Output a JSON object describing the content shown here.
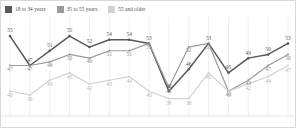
{
  "legend": {
    "position": "top-left",
    "items": [
      {
        "label": "18 to 34 years",
        "color": "#595959",
        "icon": "square-swatch"
      },
      {
        "label": "35 to 55 years",
        "color": "#9a9a9a",
        "icon": "square-swatch"
      },
      {
        "label": "55 and older",
        "color": "#d2d2d2",
        "icon": "square-swatch"
      }
    ]
  },
  "chart_data": {
    "type": "line",
    "title": "",
    "subtitle": "",
    "xlabel": "",
    "ylabel": "",
    "ylim": [
      36,
      58
    ],
    "grid": "vertical-only",
    "legend_position": "top-left",
    "x": [
      1,
      2,
      3,
      4,
      5,
      6,
      7,
      8,
      9,
      10,
      11,
      12,
      13,
      14,
      15
    ],
    "categories": [
      "",
      "",
      "",
      "",
      "",
      "",
      "",
      "",
      "",
      "",
      "",
      "",
      "",
      "",
      ""
    ],
    "series": [
      {
        "name": "18 to 34 years",
        "color": "#595959",
        "values": [
          55,
          47,
          51,
          55,
          52,
          54,
          54,
          53,
          40,
          46,
          53,
          45,
          49,
          50,
          53
        ]
      },
      {
        "name": "35 to 55 years",
        "color": "#9a9a9a",
        "values": [
          47,
          47,
          48,
          50,
          49,
          51,
          51,
          53,
          41,
          52,
          53,
          40,
          43,
          47,
          50
        ]
      },
      {
        "name": "55 and older",
        "color": "#d2d2d2",
        "values": [
          40,
          39,
          43,
          45,
          42,
          43,
          44,
          40,
          38,
          38,
          45,
          40,
          42,
          44,
          47
        ]
      }
    ]
  }
}
